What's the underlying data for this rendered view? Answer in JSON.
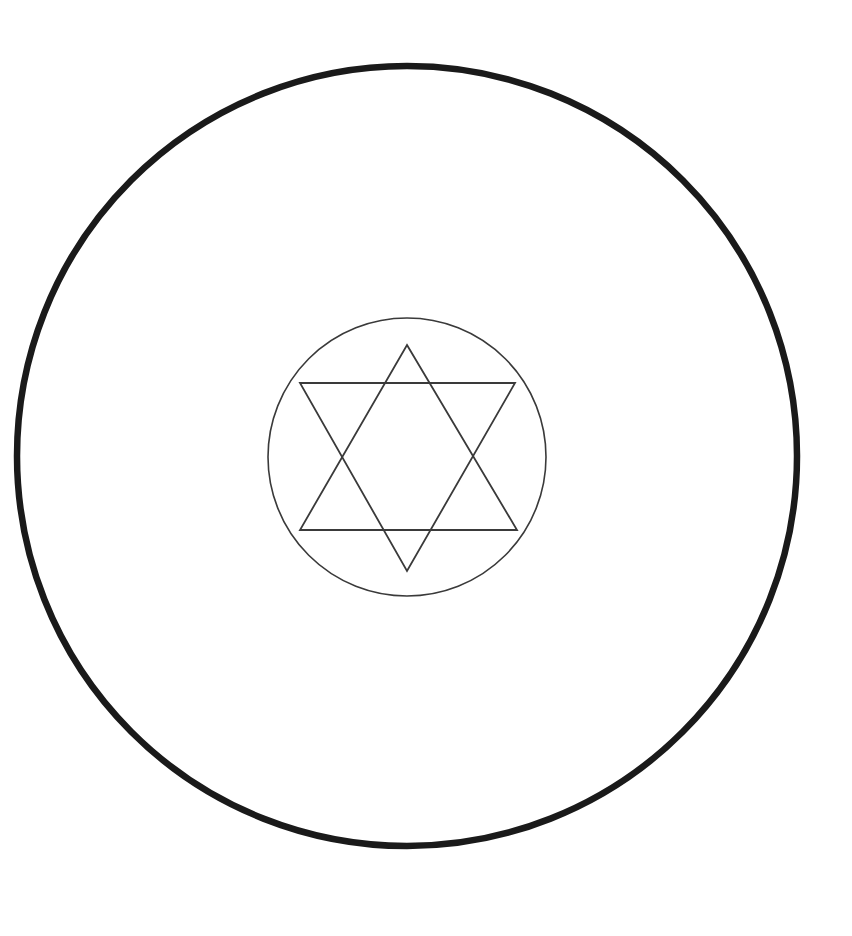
{
  "figure": {
    "background_color": "#ffffff",
    "canvas": {
      "width": 852,
      "height": 936
    },
    "outer_circle": {
      "name": "outer-circle",
      "center_x": 407,
      "center_y": 456,
      "radius": 390,
      "stroke_color": "#1a1a1a",
      "stroke_width": 6.5,
      "fill": "none"
    },
    "inner_circle": {
      "name": "inner-circle",
      "center_x": 407,
      "center_y": 457,
      "radius": 139,
      "stroke_color": "#3a3a3a",
      "stroke_width": 1.6,
      "fill": "none"
    },
    "hexagram": {
      "name": "hexagram",
      "stroke_color": "#3a3a3a",
      "stroke_width": 1.8,
      "upward_triangle": {
        "label": "upward-triangle",
        "points": "407,345 517,530 300,530"
      },
      "downward_triangle": {
        "label": "downward-triangle",
        "points": "300,383 515,383 407,571"
      }
    }
  },
  "chart_data": {
    "type": "diagram",
    "elements": [
      {
        "shape": "circle",
        "role": "outer boundary",
        "cx": 407,
        "cy": 456,
        "r": 390,
        "stroke": "#1a1a1a",
        "stroke_width": 6.5
      },
      {
        "shape": "circle",
        "role": "inner boundary",
        "cx": 407,
        "cy": 457,
        "r": 139,
        "stroke": "#3a3a3a",
        "stroke_width": 1.6
      },
      {
        "shape": "triangle",
        "role": "upward triangle",
        "vertices": [
          [
            407,
            345
          ],
          [
            517,
            530
          ],
          [
            300,
            530
          ]
        ],
        "stroke": "#3a3a3a",
        "stroke_width": 1.8
      },
      {
        "shape": "triangle",
        "role": "downward triangle",
        "vertices": [
          [
            300,
            383
          ],
          [
            515,
            383
          ],
          [
            407,
            571
          ]
        ],
        "stroke": "#3a3a3a",
        "stroke_width": 1.8
      }
    ],
    "xlabel": "",
    "ylabel": "",
    "legend": []
  }
}
